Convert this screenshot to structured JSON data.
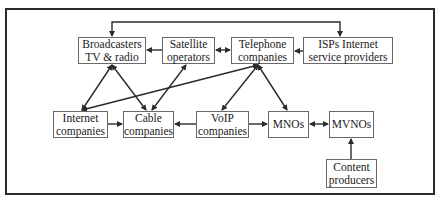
{
  "diagram": {
    "type": "flow",
    "nodes": [
      {
        "id": "broadcasters",
        "lines": [
          "Broadcasters",
          "TV & radio"
        ],
        "x": 78,
        "y": 37,
        "w": 68,
        "h": 27
      },
      {
        "id": "satellite",
        "lines": [
          "Satellite",
          "operators"
        ],
        "x": 162,
        "y": 37,
        "w": 53,
        "h": 27
      },
      {
        "id": "telephone",
        "lines": [
          "Telephone",
          "companies"
        ],
        "x": 231,
        "y": 37,
        "w": 63,
        "h": 27
      },
      {
        "id": "isps",
        "lines": [
          "ISPs Internet",
          "service providers"
        ],
        "x": 303,
        "y": 37,
        "w": 90,
        "h": 27
      },
      {
        "id": "internet",
        "lines": [
          "Internet",
          "companies"
        ],
        "x": 53,
        "y": 111,
        "w": 55,
        "h": 27
      },
      {
        "id": "cable",
        "lines": [
          "Cable",
          "companies"
        ],
        "x": 123,
        "y": 111,
        "w": 51,
        "h": 27
      },
      {
        "id": "voip",
        "lines": [
          "VoIP",
          "companies"
        ],
        "x": 196,
        "y": 111,
        "w": 53,
        "h": 27
      },
      {
        "id": "mnos",
        "lines": [
          "MNOs"
        ],
        "x": 268,
        "y": 111,
        "w": 41,
        "h": 27
      },
      {
        "id": "mvnos",
        "lines": [
          "MVNOs"
        ],
        "x": 329,
        "y": 111,
        "w": 45,
        "h": 27
      },
      {
        "id": "content",
        "lines": [
          "Content",
          "producers"
        ],
        "x": 326,
        "y": 159,
        "w": 51,
        "h": 29
      }
    ],
    "edges": [
      {
        "from": "satellite",
        "to": "broadcasters",
        "dir": "forward"
      },
      {
        "from": "satellite",
        "to": "telephone",
        "dir": "both"
      },
      {
        "from": "isps",
        "to": "telephone",
        "dir": "forward"
      },
      {
        "from": "broadcasters",
        "to": "isps",
        "dir": "both",
        "route": "top-bracket"
      },
      {
        "from": "broadcasters",
        "to": "internet",
        "dir": "both"
      },
      {
        "from": "broadcasters",
        "to": "cable",
        "dir": "both"
      },
      {
        "from": "satellite",
        "to": "cable",
        "dir": "both"
      },
      {
        "from": "internet",
        "to": "telephone",
        "dir": "both"
      },
      {
        "from": "telephone",
        "to": "voip",
        "dir": "both"
      },
      {
        "from": "telephone",
        "to": "mnos",
        "dir": "both"
      },
      {
        "from": "internet",
        "to": "cable",
        "dir": "forward"
      },
      {
        "from": "voip",
        "to": "cable",
        "dir": "forward"
      },
      {
        "from": "voip",
        "to": "mnos",
        "dir": "forward"
      },
      {
        "from": "mnos",
        "to": "mvnos",
        "dir": "both"
      },
      {
        "from": "content",
        "to": "mvnos",
        "dir": "forward"
      }
    ]
  },
  "labels": {
    "broadcasters": {
      "l1": "Broadcasters",
      "l2": "TV & radio"
    },
    "satellite": {
      "l1": "Satellite",
      "l2": "operators"
    },
    "telephone": {
      "l1": "Telephone",
      "l2": "companies"
    },
    "isps": {
      "l1": "ISPs Internet",
      "l2": "service providers"
    },
    "internet": {
      "l1": "Internet",
      "l2": "companies"
    },
    "cable": {
      "l1": "Cable",
      "l2": "companies"
    },
    "voip": {
      "l1": "VoIP",
      "l2": "companies"
    },
    "mnos": {
      "l1": "MNOs"
    },
    "mvnos": {
      "l1": "MVNOs"
    },
    "content": {
      "l1": "Content",
      "l2": "producers"
    }
  },
  "colors": {
    "line": "#2a2a2a",
    "box_border": "#6a6a6a",
    "background": "#ffffff"
  }
}
